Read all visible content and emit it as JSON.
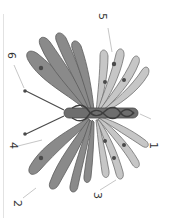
{
  "diagram": {
    "orientation": "rotated 90 degrees clockwise",
    "labels": [
      {
        "id": "1",
        "text": "1",
        "x": 153,
        "y": 145
      },
      {
        "id": "2",
        "text": "2",
        "x": 17,
        "y": 203
      },
      {
        "id": "3",
        "text": "3",
        "x": 97,
        "y": 196
      },
      {
        "id": "4",
        "text": "4",
        "x": 13,
        "y": 145
      },
      {
        "id": "5",
        "text": "5",
        "x": 102,
        "y": 16
      },
      {
        "id": "6",
        "text": "6",
        "x": 11,
        "y": 55
      }
    ],
    "colors": {
      "dark_wing": "#8a8a8a",
      "light_wing": "#c4c4c4",
      "body": "#6e6e6e",
      "outline": "#555555",
      "leader": "#b8b8b8"
    }
  }
}
